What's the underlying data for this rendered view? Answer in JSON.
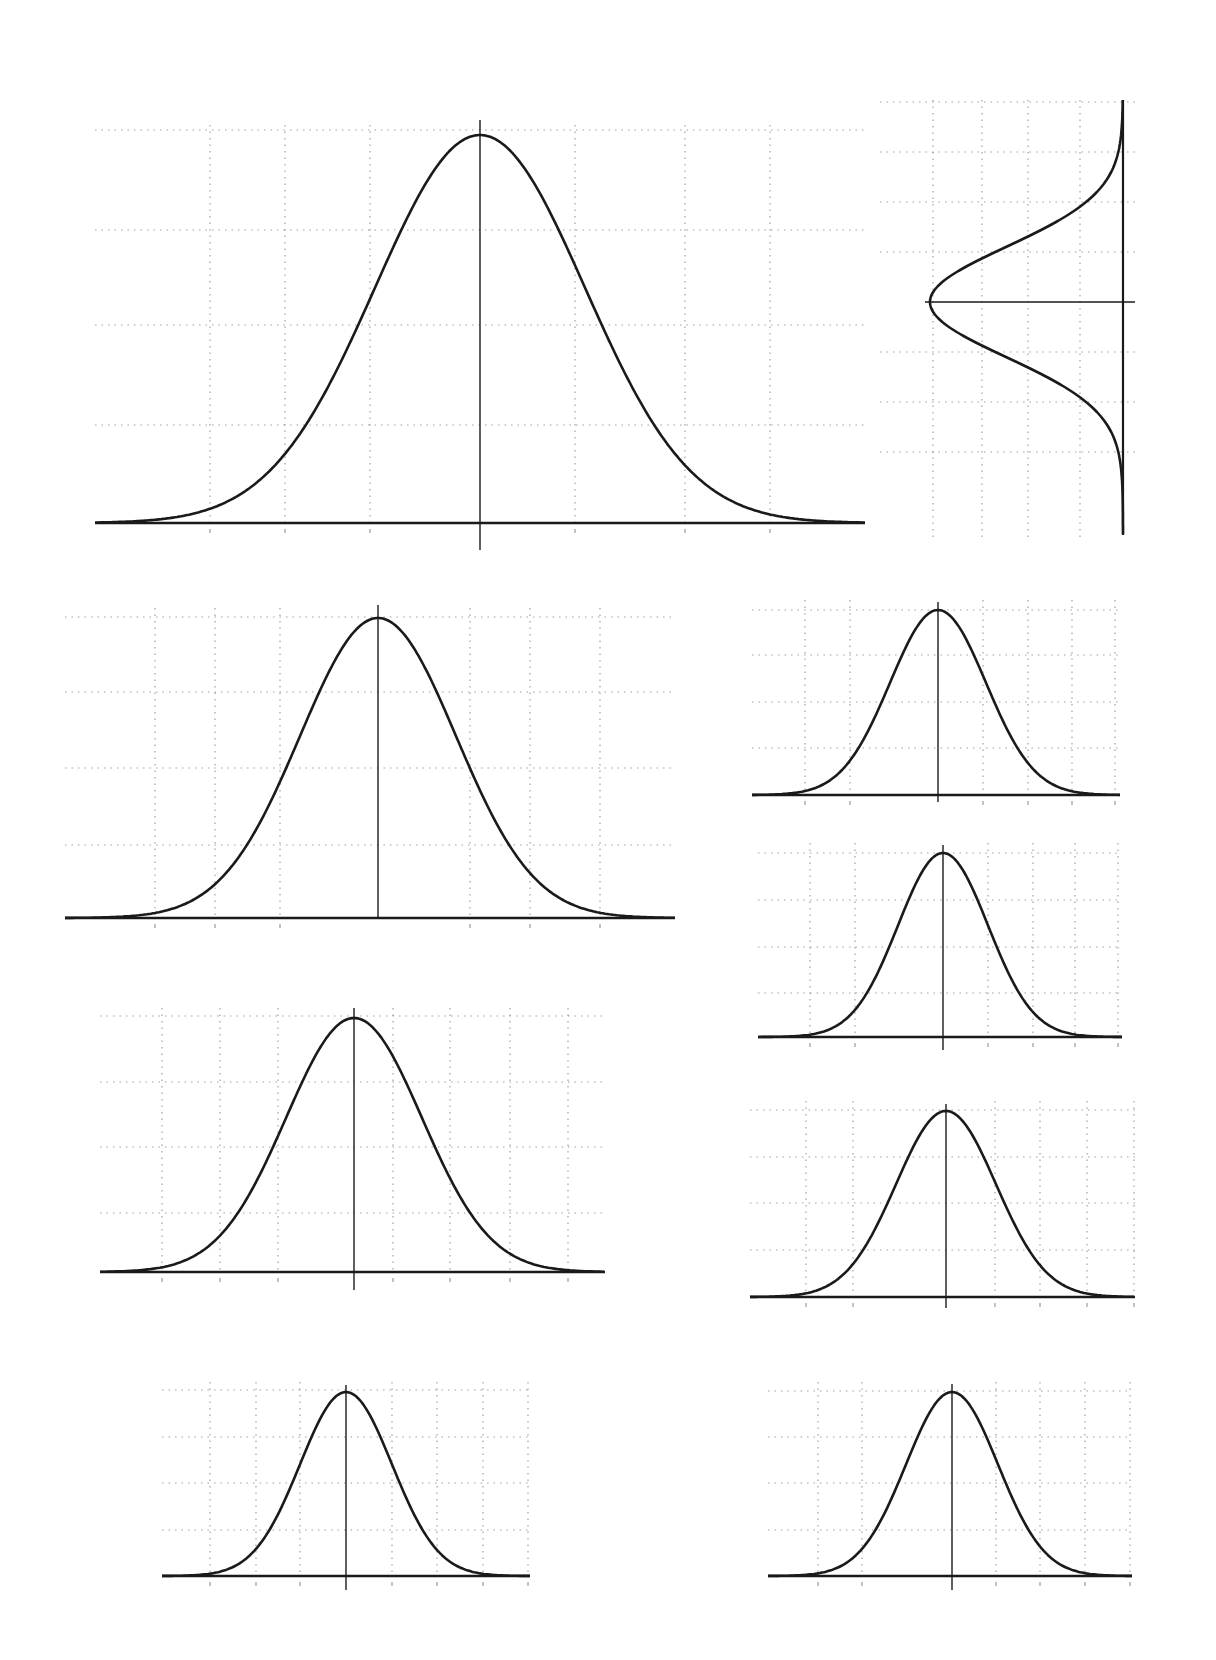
{
  "page": {
    "width": 1216,
    "height": 1660,
    "background": "#ffffff",
    "ink": "#1a1a1a",
    "grid_color": "#555555"
  },
  "chart_data": [
    {
      "id": "large-top",
      "type": "line",
      "title": "",
      "xlabel": "",
      "ylabel": "",
      "description": "Standard normal (Gaussian) bell curve with central vertical axis and dotted grid",
      "orientation": "horizontal",
      "frame": {
        "x": 60,
        "y": 95,
        "w": 800,
        "h": 460
      },
      "baseline_x": [
        95,
        865
      ],
      "baseline_y": 523,
      "center_x": 480,
      "peak_y": 135,
      "sigma_px": 105,
      "axis_top": 120,
      "axis_bottom": 550,
      "grid_y": [
        130,
        230,
        325,
        425
      ],
      "grid_x": [
        210,
        285,
        370,
        575,
        685,
        770
      ],
      "grid": true,
      "series": [
        {
          "name": "pdf",
          "function": "exp(-x^2/2)",
          "x_range": [
            -3.6,
            3.6
          ]
        }
      ]
    },
    {
      "id": "rotated-right",
      "type": "line",
      "title": "",
      "xlabel": "",
      "ylabel": "",
      "description": "Bell curve rotated 90 degrees; peak points left, baseline vertical on right",
      "orientation": "vertical",
      "frame": {
        "x": 915,
        "y": 80,
        "w": 220,
        "h": 465
      },
      "baseline_x": 1123,
      "baseline_y": [
        100,
        535
      ],
      "center_y": 302,
      "peak_x": 930,
      "sigma_px": 55,
      "axis_left": 925,
      "axis_right": 1135,
      "grid_y": [
        102,
        152,
        202,
        252,
        352,
        402,
        452
      ],
      "grid_x": [
        933,
        982,
        1028,
        1080
      ],
      "grid": true,
      "series": [
        {
          "name": "pdf",
          "function": "exp(-y^2/2)",
          "y_range": [
            -4,
            4
          ]
        }
      ]
    },
    {
      "id": "medium-left-1",
      "type": "line",
      "title": "",
      "xlabel": "",
      "ylabel": "",
      "orientation": "horizontal",
      "frame": {
        "x": 60,
        "y": 590,
        "w": 620,
        "h": 330
      },
      "baseline_x": [
        65,
        675
      ],
      "baseline_y": 918,
      "center_x": 378,
      "peak_y": 618,
      "sigma_px": 78,
      "axis_top": 605,
      "axis_bottom": 918,
      "grid_y": [
        617,
        692,
        768,
        845
      ],
      "grid_x": [
        155,
        215,
        280,
        470,
        530,
        600
      ],
      "grid": true,
      "series": [
        {
          "name": "pdf",
          "function": "exp(-x^2/2)",
          "x_range": [
            -4,
            4
          ]
        }
      ]
    },
    {
      "id": "small-right-1",
      "type": "line",
      "title": "",
      "xlabel": "",
      "ylabel": "",
      "orientation": "horizontal",
      "frame": {
        "x": 745,
        "y": 590,
        "w": 395,
        "h": 200
      },
      "baseline_x": [
        752,
        1120
      ],
      "baseline_y": 795,
      "center_x": 938,
      "peak_y": 610,
      "sigma_px": 48,
      "axis_top": 602,
      "axis_bottom": 802,
      "grid_y": [
        610,
        655,
        702,
        748
      ],
      "grid_x": [
        805,
        850,
        983,
        1028,
        1072,
        1115
      ],
      "grid": true,
      "series": [
        {
          "name": "pdf",
          "function": "exp(-x^2/2)",
          "x_range": [
            -4,
            4
          ]
        }
      ]
    },
    {
      "id": "small-right-2",
      "type": "line",
      "title": "",
      "xlabel": "",
      "ylabel": "",
      "orientation": "horizontal",
      "frame": {
        "x": 745,
        "y": 840,
        "w": 395,
        "h": 200
      },
      "baseline_x": [
        758,
        1122
      ],
      "baseline_y": 1037,
      "center_x": 943,
      "peak_y": 853,
      "sigma_px": 45,
      "axis_top": 845,
      "axis_bottom": 1050,
      "grid_y": [
        853,
        900,
        947,
        993
      ],
      "grid_x": [
        810,
        855,
        988,
        1033,
        1075,
        1118
      ],
      "grid": true,
      "series": [
        {
          "name": "pdf",
          "function": "exp(-x^2/2)",
          "x_range": [
            -4,
            4
          ]
        }
      ]
    },
    {
      "id": "medium-left-2",
      "type": "line",
      "title": "",
      "xlabel": "",
      "ylabel": "",
      "orientation": "horizontal",
      "frame": {
        "x": 80,
        "y": 990,
        "w": 540,
        "h": 290
      },
      "baseline_x": [
        100,
        605
      ],
      "baseline_y": 1272,
      "center_x": 354,
      "peak_y": 1018,
      "sigma_px": 68,
      "axis_top": 1008,
      "axis_bottom": 1290,
      "grid_y": [
        1016,
        1082,
        1147,
        1213
      ],
      "grid_x": [
        162,
        220,
        278,
        393,
        450,
        510,
        568
      ],
      "grid": true,
      "series": [
        {
          "name": "pdf",
          "function": "exp(-x^2/2)",
          "x_range": [
            -4,
            4
          ]
        }
      ]
    },
    {
      "id": "small-right-3",
      "type": "line",
      "title": "",
      "xlabel": "",
      "ylabel": "",
      "orientation": "horizontal",
      "frame": {
        "x": 730,
        "y": 1090,
        "w": 410,
        "h": 220
      },
      "baseline_x": [
        750,
        1135
      ],
      "baseline_y": 1297,
      "center_x": 946,
      "peak_y": 1111,
      "sigma_px": 50,
      "axis_top": 1104,
      "axis_bottom": 1308,
      "grid_y": [
        1110,
        1157,
        1203,
        1250
      ],
      "grid_x": [
        806,
        853,
        995,
        1040,
        1087,
        1134
      ],
      "grid": true,
      "series": [
        {
          "name": "pdf",
          "function": "exp(-x^2/2)",
          "x_range": [
            -4,
            4
          ]
        }
      ]
    },
    {
      "id": "small-left-bottom",
      "type": "line",
      "title": "",
      "xlabel": "",
      "ylabel": "",
      "orientation": "horizontal",
      "frame": {
        "x": 160,
        "y": 1370,
        "w": 380,
        "h": 210
      },
      "baseline_x": [
        162,
        530
      ],
      "baseline_y": 1576,
      "center_x": 346,
      "peak_y": 1392,
      "sigma_px": 46,
      "axis_top": 1385,
      "axis_bottom": 1590,
      "grid_y": [
        1390,
        1437,
        1483,
        1530
      ],
      "grid_x": [
        210,
        256,
        300,
        392,
        437,
        483,
        528
      ],
      "grid": true,
      "series": [
        {
          "name": "pdf",
          "function": "exp(-x^2/2)",
          "x_range": [
            -4,
            4
          ]
        }
      ]
    },
    {
      "id": "small-right-bottom",
      "type": "line",
      "title": "",
      "xlabel": "",
      "ylabel": "",
      "orientation": "horizontal",
      "frame": {
        "x": 760,
        "y": 1370,
        "w": 380,
        "h": 210
      },
      "baseline_x": [
        768,
        1132
      ],
      "baseline_y": 1576,
      "center_x": 952,
      "peak_y": 1392,
      "sigma_px": 46,
      "axis_top": 1384,
      "axis_bottom": 1590,
      "grid_y": [
        1391,
        1437,
        1483,
        1530
      ],
      "grid_x": [
        818,
        862,
        996,
        1040,
        1085,
        1130
      ],
      "grid": true,
      "series": [
        {
          "name": "pdf",
          "function": "exp(-x^2/2)",
          "x_range": [
            -4,
            4
          ]
        }
      ]
    }
  ]
}
